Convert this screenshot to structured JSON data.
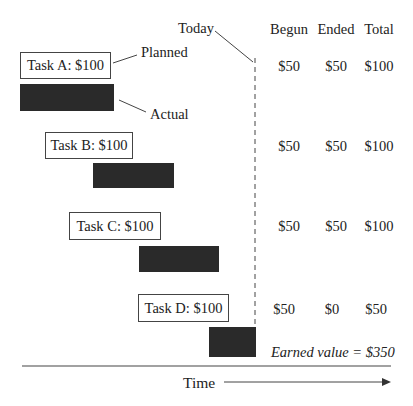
{
  "diagram": {
    "today_label": "Today",
    "planned_label": "Planned",
    "actual_label": "Actual",
    "time_label": "Time",
    "earned_value_label": "Earned value = $350",
    "columns": [
      "Begun",
      "Ended",
      "Total"
    ],
    "tasks": [
      {
        "label": "Task A: $100",
        "begun": "$50",
        "ended": "$50",
        "total": "$100"
      },
      {
        "label": "Task B: $100",
        "begun": "$50",
        "ended": "$50",
        "total": "$100"
      },
      {
        "label": "Task C: $100",
        "begun": "$50",
        "ended": "$50",
        "total": "$100"
      },
      {
        "label": "Task D: $100",
        "begun": "$50",
        "ended": "$0",
        "total": "$50"
      }
    ],
    "colors": {
      "actual_bar": "#2a2a2a",
      "line": "#444444"
    }
  }
}
